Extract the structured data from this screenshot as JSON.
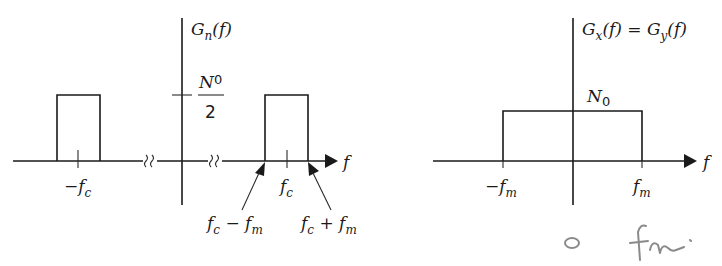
{
  "left_plot": {
    "title": "G",
    "title_sub": "n",
    "title_suffix": "(f)",
    "level_numerator": "N",
    "level_numerator_sub": "0",
    "level_denominator": "2",
    "axis_label": "f",
    "tick_neg": "−f",
    "tick_neg_sub": "c",
    "tick_pos": "f",
    "tick_pos_sub": "c",
    "arrow_left": {
      "a": "f",
      "a_sub": "c",
      "op": " − ",
      "b": "f",
      "b_sub": "m"
    },
    "arrow_right": {
      "a": "f",
      "a_sub": "c",
      "op": " + ",
      "b": "f",
      "b_sub": "m"
    }
  },
  "right_plot": {
    "title_a": "G",
    "title_a_sub": "x",
    "title_mid": "(f) = G",
    "title_b_sub": "y",
    "title_suffix": "(f)",
    "level": "N",
    "level_sub": "0",
    "axis_label": "f",
    "tick_neg": "−f",
    "tick_neg_sub": "m",
    "tick_pos": "f",
    "tick_pos_sub": "m"
  },
  "handwritten_note": "0   fm.",
  "colors": {
    "ink": "#1a1a1a",
    "pencil": "#8a8a8a",
    "background": "#ffffff"
  }
}
